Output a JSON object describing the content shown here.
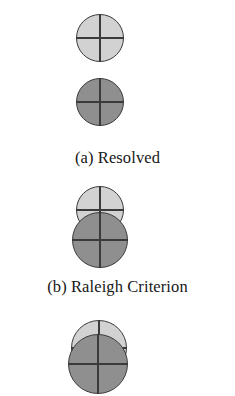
{
  "figure": {
    "background_color": "#ffffff",
    "line_color": "#3a3a3a",
    "text_color": "#171717",
    "light_disc_color": "#d2d2d2",
    "dark_disc_color": "#8f8f8f"
  },
  "panels": [
    {
      "id": "a",
      "caption": "(a) Resolved",
      "discs": [
        {
          "name": "upper-disc",
          "fill": "#d2d2d2",
          "crosshair": true
        },
        {
          "name": "lower-disc",
          "fill": "#8f8f8f",
          "crosshair": true
        }
      ],
      "overlap": "none"
    },
    {
      "id": "b",
      "caption": "(b) Raleigh Criterion",
      "discs": [
        {
          "name": "upper-disc",
          "fill": "#d2d2d2",
          "crosshair": true
        },
        {
          "name": "lower-disc",
          "fill": "#8f8f8f",
          "crosshair": true
        }
      ],
      "overlap": "partial"
    },
    {
      "id": "c",
      "caption": "",
      "discs": [
        {
          "name": "upper-disc",
          "fill": "#d2d2d2",
          "crosshair": true
        },
        {
          "name": "lower-disc",
          "fill": "#8f8f8f",
          "crosshair": true
        }
      ],
      "overlap": "heavy"
    }
  ]
}
